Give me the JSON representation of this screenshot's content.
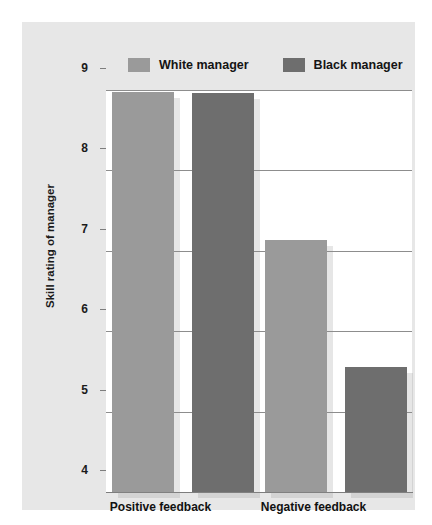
{
  "chart_data": {
    "type": "bar",
    "title": "",
    "xlabel": "",
    "ylabel": "Skill rating of manager",
    "categories": [
      "Positive feedback",
      "Negative feedback"
    ],
    "series": [
      {
        "name": "White manager",
        "color": "#9a9a9a",
        "values": [
          8.97,
          7.13
        ]
      },
      {
        "name": "Black manager",
        "color": "#6e6e6e",
        "values": [
          8.96,
          5.55
        ]
      }
    ],
    "ylim": [
      4,
      9
    ],
    "yticks": [
      9,
      8,
      7,
      6,
      5,
      4
    ],
    "ytick_labels": [
      "9",
      "8",
      "7",
      "6",
      "5",
      "4"
    ],
    "grid": true,
    "legend_position": "top"
  },
  "legend": {
    "items": [
      {
        "label": "White manager",
        "swatch": "legend-swatch-white-manager"
      },
      {
        "label": "Black manager",
        "swatch": "legend-swatch-black-manager"
      }
    ]
  },
  "colors": {
    "page_background": "#ffffff",
    "panel_background": "#e7e7e7",
    "plot_background": "#ffffff",
    "gridline": "#8d8d8d",
    "axis": "#7d7d7d",
    "white_manager_bar": "#9a9a9a",
    "black_manager_bar": "#6e6e6e",
    "text": "#1b1b1b"
  }
}
